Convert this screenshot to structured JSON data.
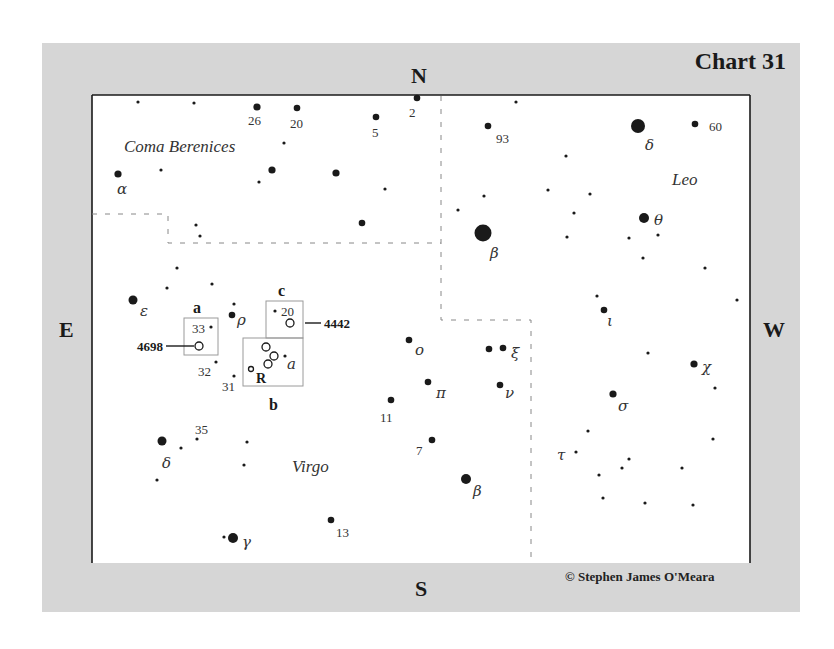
{
  "chart": {
    "title": "Chart 31",
    "copyright": "© Stephen James O'Meara",
    "compass": {
      "north": "N",
      "south": "S",
      "east": "E",
      "west": "W"
    },
    "colors": {
      "frame": "#d6d6d6",
      "field": "#ffffff",
      "ink": "#1a1a1a",
      "boundary": "#888888",
      "box": "#9a9a9a"
    }
  },
  "constellations": [
    {
      "name": "Coma Berenices",
      "x": 124,
      "y": 152
    },
    {
      "name": "Leo",
      "x": 672,
      "y": 185
    },
    {
      "name": "Virgo",
      "x": 292,
      "y": 472
    }
  ],
  "finder_boxes": [
    {
      "id": "a",
      "label": "a",
      "x": 184,
      "y": 318,
      "w": 34,
      "h": 37,
      "label_x": 193,
      "label_y": 313
    },
    {
      "id": "b",
      "label": "b",
      "x": 243,
      "y": 338,
      "w": 60,
      "h": 48,
      "label_x": 269,
      "label_y": 410
    },
    {
      "id": "c",
      "label": "c",
      "x": 266,
      "y": 301,
      "w": 37,
      "h": 37,
      "label_x": 278,
      "label_y": 296
    }
  ],
  "galaxies": [
    {
      "label": "4698",
      "x": 199,
      "y": 346,
      "r": 4,
      "leader": [
        166,
        346,
        194,
        346
      ],
      "label_x": 163,
      "label_y": 351,
      "anchor": "end"
    },
    {
      "label": "4442",
      "x": 290,
      "y": 323,
      "r": 4,
      "leader": [
        305,
        323,
        321,
        323
      ],
      "label_x": 324,
      "label_y": 328,
      "anchor": "start"
    },
    {
      "label": "",
      "x": 266,
      "y": 347,
      "r": 4
    },
    {
      "label": "",
      "x": 274,
      "y": 356,
      "r": 4
    },
    {
      "label": "",
      "x": 268,
      "y": 364,
      "r": 4
    },
    {
      "label": "",
      "x": 251,
      "y": 369,
      "r": 2.5
    }
  ],
  "stars": [
    {
      "x": 138,
      "y": 102,
      "r": 1.6,
      "label": ""
    },
    {
      "x": 194,
      "y": 103,
      "r": 1.6,
      "label": ""
    },
    {
      "x": 257,
      "y": 107,
      "r": 3.6,
      "label": "26",
      "lx": 248,
      "ly": 125,
      "greek": false
    },
    {
      "x": 297,
      "y": 108,
      "r": 3.3,
      "label": "20",
      "lx": 290,
      "ly": 128,
      "greek": false
    },
    {
      "x": 376,
      "y": 117,
      "r": 3.3,
      "label": "5",
      "lx": 372,
      "ly": 137,
      "greek": false
    },
    {
      "x": 417,
      "y": 98,
      "r": 3.3,
      "label": "2",
      "lx": 409,
      "ly": 117,
      "greek": false
    },
    {
      "x": 284,
      "y": 143,
      "r": 1.6,
      "label": ""
    },
    {
      "x": 161,
      "y": 170,
      "r": 1.6,
      "label": ""
    },
    {
      "x": 118,
      "y": 174,
      "r": 3.6,
      "label": "α",
      "lx": 117,
      "ly": 194,
      "greek": true
    },
    {
      "x": 272,
      "y": 170,
      "r": 3.6,
      "label": ""
    },
    {
      "x": 259,
      "y": 182,
      "r": 1.6,
      "label": ""
    },
    {
      "x": 336,
      "y": 173,
      "r": 3.6,
      "label": ""
    },
    {
      "x": 385,
      "y": 189,
      "r": 1.6,
      "label": ""
    },
    {
      "x": 362,
      "y": 223,
      "r": 3.3,
      "label": ""
    },
    {
      "x": 196,
      "y": 225,
      "r": 1.6,
      "label": ""
    },
    {
      "x": 200,
      "y": 236,
      "r": 1.6,
      "label": ""
    },
    {
      "x": 488,
      "y": 126,
      "r": 3.3,
      "label": "93",
      "lx": 496,
      "ly": 143,
      "greek": false
    },
    {
      "x": 516,
      "y": 102,
      "r": 1.6,
      "label": ""
    },
    {
      "x": 638,
      "y": 126,
      "r": 7,
      "label": "δ",
      "lx": 645,
      "ly": 150,
      "greek": true
    },
    {
      "x": 695,
      "y": 124,
      "r": 3.3,
      "label": "60",
      "lx": 709,
      "ly": 131,
      "greek": false
    },
    {
      "x": 566,
      "y": 156,
      "r": 1.6,
      "label": ""
    },
    {
      "x": 484,
      "y": 196,
      "r": 1.6,
      "label": ""
    },
    {
      "x": 548,
      "y": 190,
      "r": 1.6,
      "label": ""
    },
    {
      "x": 590,
      "y": 194,
      "r": 1.6,
      "label": ""
    },
    {
      "x": 458,
      "y": 210,
      "r": 1.6,
      "label": ""
    },
    {
      "x": 574,
      "y": 213,
      "r": 1.6,
      "label": ""
    },
    {
      "x": 644,
      "y": 218,
      "r": 5,
      "label": "θ",
      "lx": 654,
      "ly": 225,
      "greek": true
    },
    {
      "x": 658,
      "y": 235,
      "r": 1.6,
      "label": ""
    },
    {
      "x": 483,
      "y": 233,
      "r": 8.5,
      "label": "β",
      "lx": 490,
      "ly": 258,
      "greek": true
    },
    {
      "x": 567,
      "y": 237,
      "r": 1.6,
      "label": ""
    },
    {
      "x": 629,
      "y": 238,
      "r": 1.6,
      "label": ""
    },
    {
      "x": 643,
      "y": 258,
      "r": 1.6,
      "label": ""
    },
    {
      "x": 705,
      "y": 268,
      "r": 1.6,
      "label": ""
    },
    {
      "x": 737,
      "y": 300,
      "r": 1.6,
      "label": ""
    },
    {
      "x": 597,
      "y": 296,
      "r": 1.6,
      "label": ""
    },
    {
      "x": 604,
      "y": 310,
      "r": 3.3,
      "label": "ι",
      "lx": 607,
      "ly": 326,
      "greek": true
    },
    {
      "x": 177,
      "y": 268,
      "r": 1.6,
      "label": ""
    },
    {
      "x": 167,
      "y": 288,
      "r": 1.6,
      "label": ""
    },
    {
      "x": 212,
      "y": 284,
      "r": 1.6,
      "label": ""
    },
    {
      "x": 133,
      "y": 300,
      "r": 4.5,
      "label": "ε",
      "lx": 140,
      "ly": 316,
      "greek": true
    },
    {
      "x": 234,
      "y": 304,
      "r": 1.6,
      "label": ""
    },
    {
      "x": 232,
      "y": 315,
      "r": 3.3,
      "label": "ρ",
      "lx": 237,
      "ly": 325,
      "greek": true
    },
    {
      "x": 211,
      "y": 327,
      "r": 1.6,
      "label": "33",
      "lx": 192,
      "ly": 333,
      "greek": false
    },
    {
      "x": 275,
      "y": 311,
      "r": 1.6,
      "label": "20",
      "lx": 281,
      "ly": 316,
      "greek": false
    },
    {
      "x": 285,
      "y": 356,
      "r": 1.6,
      "label": "a",
      "lx": 287,
      "ly": 369,
      "greek": true
    },
    {
      "x": 216,
      "y": 362,
      "r": 1.6,
      "label": "32",
      "lx": 198,
      "ly": 376,
      "greek": false
    },
    {
      "x": 234,
      "y": 376,
      "r": 1.6,
      "label": "31",
      "lx": 222,
      "ly": 391,
      "greek": false
    },
    {
      "x": 409,
      "y": 340,
      "r": 3.3,
      "label": "o",
      "lx": 415,
      "ly": 355,
      "greek": true
    },
    {
      "x": 489,
      "y": 349,
      "r": 3.3,
      "label": ""
    },
    {
      "x": 503,
      "y": 348,
      "r": 3.3,
      "label": "ξ",
      "lx": 511,
      "ly": 358,
      "greek": true
    },
    {
      "x": 428,
      "y": 382,
      "r": 3.3,
      "label": "π",
      "lx": 436,
      "ly": 398,
      "greek": true
    },
    {
      "x": 500,
      "y": 385,
      "r": 3.3,
      "label": "ν",
      "lx": 505,
      "ly": 398,
      "greek": true
    },
    {
      "x": 391,
      "y": 400,
      "r": 3.3,
      "label": "11",
      "lx": 380,
      "ly": 422,
      "greek": false
    },
    {
      "x": 432,
      "y": 440,
      "r": 3.3,
      "label": "7",
      "lx": 416,
      "ly": 455,
      "greek": false
    },
    {
      "x": 466,
      "y": 479,
      "r": 5,
      "label": "β",
      "lx": 473,
      "ly": 496,
      "greek": true
    },
    {
      "x": 331,
      "y": 520,
      "r": 3.3,
      "label": "13",
      "lx": 336,
      "ly": 537,
      "greek": false
    },
    {
      "x": 648,
      "y": 353,
      "r": 1.6,
      "label": ""
    },
    {
      "x": 694,
      "y": 364,
      "r": 3.6,
      "label": "χ",
      "lx": 702,
      "ly": 372,
      "greek": true
    },
    {
      "x": 715,
      "y": 388,
      "r": 1.6,
      "label": ""
    },
    {
      "x": 613,
      "y": 394,
      "r": 3.6,
      "label": "σ",
      "lx": 618,
      "ly": 411,
      "greek": true
    },
    {
      "x": 588,
      "y": 431,
      "r": 1.6,
      "label": ""
    },
    {
      "x": 713,
      "y": 439,
      "r": 1.6,
      "label": ""
    },
    {
      "x": 576,
      "y": 452,
      "r": 1.6,
      "label": "τ",
      "lx": 557,
      "ly": 460,
      "greek": true
    },
    {
      "x": 629,
      "y": 459,
      "r": 1.6,
      "label": ""
    },
    {
      "x": 622,
      "y": 468,
      "r": 1.6,
      "label": ""
    },
    {
      "x": 599,
      "y": 475,
      "r": 1.6,
      "label": ""
    },
    {
      "x": 682,
      "y": 468,
      "r": 1.6,
      "label": ""
    },
    {
      "x": 603,
      "y": 498,
      "r": 1.6,
      "label": ""
    },
    {
      "x": 645,
      "y": 503,
      "r": 1.6,
      "label": ""
    },
    {
      "x": 693,
      "y": 505,
      "r": 1.6,
      "label": ""
    },
    {
      "x": 162,
      "y": 441,
      "r": 4.5,
      "label": "δ",
      "lx": 162,
      "ly": 468,
      "greek": true
    },
    {
      "x": 181,
      "y": 448,
      "r": 1.6,
      "label": ""
    },
    {
      "x": 197,
      "y": 439,
      "r": 1.6,
      "label": "35",
      "lx": 195,
      "ly": 434,
      "greek": false
    },
    {
      "x": 247,
      "y": 442,
      "r": 1.6,
      "label": ""
    },
    {
      "x": 244,
      "y": 465,
      "r": 1.6,
      "label": ""
    },
    {
      "x": 157,
      "y": 480,
      "r": 1.6,
      "label": ""
    },
    {
      "x": 224,
      "y": 537,
      "r": 1.6,
      "label": ""
    },
    {
      "x": 233,
      "y": 538,
      "r": 5,
      "label": "γ",
      "lx": 242,
      "ly": 547,
      "greek": true
    }
  ],
  "boundaries": [
    {
      "points": [
        [
          92,
          214
        ],
        [
          168,
          214
        ],
        [
          168,
          243
        ],
        [
          441,
          243
        ]
      ]
    },
    {
      "points": [
        [
          441,
          96
        ],
        [
          441,
          320
        ],
        [
          531,
          320
        ],
        [
          531,
          563
        ]
      ]
    }
  ],
  "inner_field": {
    "x": 92,
    "y": 95,
    "w": 658,
    "h": 468
  }
}
